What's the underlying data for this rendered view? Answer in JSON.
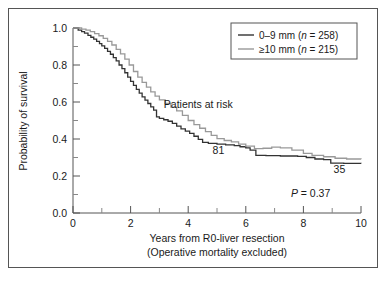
{
  "chart_data": {
    "type": "line",
    "title": "",
    "xlabel": "Years from R0-liver resection",
    "xlabel2": "(Operative mortality excluded)",
    "ylabel": "Probability of survival",
    "xlim": [
      0,
      10
    ],
    "ylim": [
      0,
      1.0
    ],
    "xticks": [
      0,
      2,
      4,
      6,
      8,
      10
    ],
    "xtick_labels": [
      "0",
      "2",
      "4",
      "6",
      "8",
      "10"
    ],
    "xminor_step": 1,
    "yticks": [
      0.0,
      0.2,
      0.4,
      0.6,
      0.8,
      1.0
    ],
    "ytick_labels": [
      "0.0",
      "0.2",
      "0.4",
      "0.6",
      "0.8",
      "1.0"
    ],
    "yminor_step": 0.1,
    "grid": false,
    "legend_position": "top-right",
    "series": [
      {
        "name": "0–9 mm (n = 258)",
        "label_prefix": "0–9 mm (",
        "label_italic": "n",
        "label_suffix": " = 258)",
        "color": "#333333",
        "points": [
          [
            0.0,
            1.0
          ],
          [
            0.1,
            1.0
          ],
          [
            0.18,
            0.988
          ],
          [
            0.3,
            0.98
          ],
          [
            0.4,
            0.972
          ],
          [
            0.52,
            0.96
          ],
          [
            0.62,
            0.95
          ],
          [
            0.72,
            0.94
          ],
          [
            0.82,
            0.928
          ],
          [
            0.92,
            0.916
          ],
          [
            1.0,
            0.903
          ],
          [
            1.1,
            0.89
          ],
          [
            1.2,
            0.874
          ],
          [
            1.3,
            0.858
          ],
          [
            1.4,
            0.84
          ],
          [
            1.5,
            0.822
          ],
          [
            1.6,
            0.8
          ],
          [
            1.7,
            0.78
          ],
          [
            1.8,
            0.758
          ],
          [
            1.9,
            0.735
          ],
          [
            2.0,
            0.712
          ],
          [
            2.1,
            0.69
          ],
          [
            2.2,
            0.668
          ],
          [
            2.3,
            0.648
          ],
          [
            2.4,
            0.628
          ],
          [
            2.5,
            0.61
          ],
          [
            2.6,
            0.592
          ],
          [
            2.7,
            0.574
          ],
          [
            2.8,
            0.556
          ],
          [
            2.9,
            0.52
          ],
          [
            3.0,
            0.512
          ],
          [
            3.15,
            0.504
          ],
          [
            3.3,
            0.496
          ],
          [
            3.45,
            0.485
          ],
          [
            3.6,
            0.47
          ],
          [
            3.75,
            0.455
          ],
          [
            3.9,
            0.443
          ],
          [
            4.05,
            0.43
          ],
          [
            4.2,
            0.415
          ],
          [
            4.35,
            0.398
          ],
          [
            4.5,
            0.382
          ],
          [
            4.7,
            0.376
          ],
          [
            5.0,
            0.372
          ],
          [
            5.3,
            0.368
          ],
          [
            5.6,
            0.364
          ],
          [
            5.8,
            0.358
          ],
          [
            6.0,
            0.352
          ],
          [
            6.15,
            0.34
          ],
          [
            6.35,
            0.312
          ],
          [
            6.7,
            0.31
          ],
          [
            7.2,
            0.308
          ],
          [
            7.8,
            0.306
          ],
          [
            8.1,
            0.3
          ],
          [
            8.4,
            0.292
          ],
          [
            8.7,
            0.288
          ],
          [
            8.95,
            0.27
          ],
          [
            9.4,
            0.268
          ],
          [
            10.0,
            0.267
          ]
        ]
      },
      {
        "name": "≥10 mm (n = 215)",
        "label_prefix": "≥10 mm (",
        "label_italic": "n",
        "label_suffix": " = 215)",
        "color": "#999999",
        "points": [
          [
            0.0,
            1.0
          ],
          [
            0.15,
            1.0
          ],
          [
            0.3,
            0.994
          ],
          [
            0.45,
            0.988
          ],
          [
            0.6,
            0.98
          ],
          [
            0.75,
            0.97
          ],
          [
            0.9,
            0.958
          ],
          [
            1.05,
            0.944
          ],
          [
            1.2,
            0.928
          ],
          [
            1.35,
            0.908
          ],
          [
            1.5,
            0.885
          ],
          [
            1.65,
            0.86
          ],
          [
            1.8,
            0.832
          ],
          [
            1.95,
            0.8
          ],
          [
            2.1,
            0.765
          ],
          [
            2.25,
            0.735
          ],
          [
            2.4,
            0.706
          ],
          [
            2.55,
            0.68
          ],
          [
            2.7,
            0.655
          ],
          [
            2.85,
            0.632
          ],
          [
            3.0,
            0.612
          ],
          [
            3.2,
            0.592
          ],
          [
            3.4,
            0.572
          ],
          [
            3.6,
            0.552
          ],
          [
            3.8,
            0.528
          ],
          [
            4.0,
            0.5
          ],
          [
            4.2,
            0.478
          ],
          [
            4.4,
            0.458
          ],
          [
            4.6,
            0.44
          ],
          [
            4.8,
            0.42
          ],
          [
            5.0,
            0.402
          ],
          [
            5.25,
            0.392
          ],
          [
            5.5,
            0.384
          ],
          [
            5.75,
            0.372
          ],
          [
            6.0,
            0.362
          ],
          [
            6.3,
            0.348
          ],
          [
            6.6,
            0.35
          ],
          [
            6.9,
            0.356
          ],
          [
            7.2,
            0.352
          ],
          [
            7.6,
            0.34
          ],
          [
            8.0,
            0.322
          ],
          [
            8.3,
            0.312
          ],
          [
            8.7,
            0.304
          ],
          [
            9.1,
            0.296
          ],
          [
            9.5,
            0.292
          ],
          [
            10.0,
            0.29
          ]
        ]
      }
    ],
    "annotations": [
      {
        "text": "Patients at risk",
        "x": 4.35,
        "y": 0.565,
        "name": "patients-at-risk-label"
      },
      {
        "text": "81",
        "x": 5.05,
        "y": 0.318,
        "name": "at-risk-count-black"
      },
      {
        "text": "35",
        "x": 9.25,
        "y": 0.215,
        "name": "at-risk-count-gray"
      }
    ],
    "pvalue": {
      "italic": "P",
      "text": " = 0.37",
      "x": 8.25,
      "y": 0.085
    }
  },
  "colors": {
    "series_black": "#333333",
    "series_gray": "#999999",
    "axis": "#555555",
    "text": "#1a1a1a",
    "frame": "#555555",
    "background": "#ffffff"
  }
}
